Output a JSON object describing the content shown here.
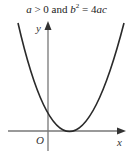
{
  "caption": {
    "a": "a",
    "gt_zero": " > 0 and ",
    "b": "b",
    "exp": "2",
    "eq": " = 4",
    "ac": "ac"
  },
  "axes": {
    "x_label": "x",
    "y_label": "y",
    "origin_label": "O"
  },
  "curve": {
    "type": "parabola",
    "opens": "upward",
    "vertex_on_x_axis": true,
    "vertex_side": "positive x",
    "stroke_color": "#2a2a2a"
  }
}
